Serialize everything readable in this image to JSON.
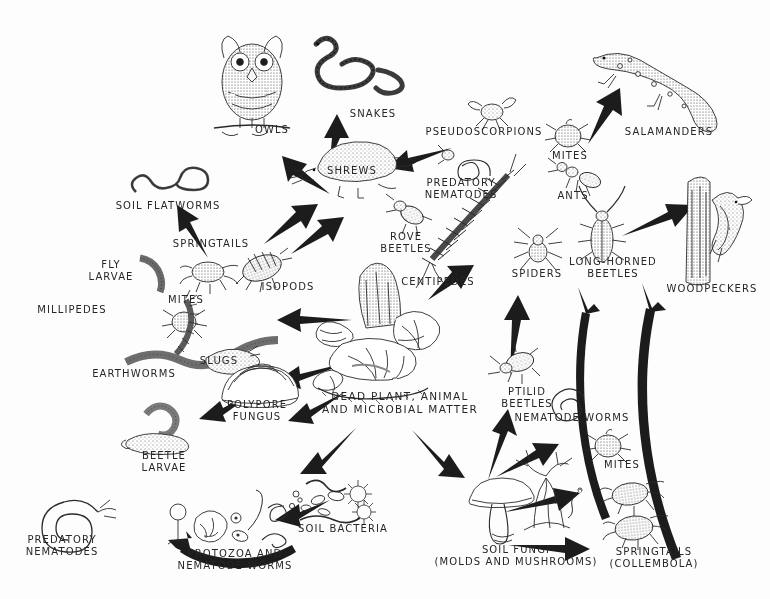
{
  "diagram": {
    "background_color": "#fdfdfd",
    "ink_color": "#262626",
    "style": "pen-and-ink hand-lettered illustration"
  },
  "center": {
    "label": "DEAD PLANT, ANIMAL\nAND MICROBIAL MATTER",
    "icon": "leaf-litter-wood-pile-icon"
  },
  "nodes": [
    {
      "id": "owls",
      "label": "OWLS",
      "icon": "owl-icon",
      "x": 272,
      "y": 131,
      "trophic": "predator"
    },
    {
      "id": "snakes",
      "label": "SNAKES",
      "icon": "snake-icon",
      "x": 373,
      "y": 115,
      "trophic": "predator"
    },
    {
      "id": "shrews",
      "label": "SHREWS",
      "icon": "shrew-icon",
      "x": 352,
      "y": 172,
      "trophic": "predator"
    },
    {
      "id": "salamanders",
      "label": "SALAMANDERS",
      "icon": "salamander-icon",
      "x": 669,
      "y": 133,
      "trophic": "predator"
    },
    {
      "id": "woodpeckers",
      "label": "WOODPECKERS",
      "icon": "woodpecker-on-trunk-icon",
      "x": 712,
      "y": 290,
      "trophic": "predator"
    },
    {
      "id": "pseudoscorpions",
      "label": "PSEUDOSCORPIONS",
      "icon": "pseudoscorpion-icon",
      "x": 484,
      "y": 133,
      "trophic": "predator"
    },
    {
      "id": "mites-upper",
      "label": "MITES",
      "icon": "mite-icon",
      "x": 570,
      "y": 157,
      "trophic": "predator"
    },
    {
      "id": "ants",
      "label": "ANTS",
      "icon": "ant-icon",
      "x": 573,
      "y": 197,
      "trophic": "predator"
    },
    {
      "id": "predatory-nematodes-upper",
      "label": "PREDATORY\nNEMATODES",
      "icon": "coiled-nematode-icon",
      "x": 461,
      "y": 190,
      "trophic": "predator"
    },
    {
      "id": "rove-beetles",
      "label": "ROVE\nBEETLES",
      "icon": "rove-beetle-icon",
      "x": 406,
      "y": 238,
      "trophic": "predator"
    },
    {
      "id": "centipedes",
      "label": "CENTIPEDES",
      "icon": "centipede-icon",
      "x": 438,
      "y": 283,
      "trophic": "predator"
    },
    {
      "id": "spiders",
      "label": "SPIDERS",
      "icon": "spider-icon",
      "x": 537,
      "y": 275,
      "trophic": "predator"
    },
    {
      "id": "long-horned-beetles",
      "label": "LONG-HORNED\nBEETLES",
      "icon": "long-horned-beetle-icon",
      "x": 613,
      "y": 262,
      "trophic": "predator"
    },
    {
      "id": "soil-flatworms",
      "label": "SOIL FLATWORMS",
      "icon": "flatworm-icon",
      "x": 168,
      "y": 207,
      "trophic": "predator"
    },
    {
      "id": "springtails-upper",
      "label": "SPRINGTAILS",
      "icon": "springtail-icon",
      "x": 211,
      "y": 245,
      "trophic": "shredder"
    },
    {
      "id": "fly-larvae",
      "label": "FLY\nLARVAE",
      "icon": "fly-larva-icon",
      "x": 111,
      "y": 272,
      "trophic": "shredder"
    },
    {
      "id": "isopods",
      "label": "ISOPODS",
      "icon": "isopod-icon",
      "x": 288,
      "y": 288,
      "trophic": "shredder"
    },
    {
      "id": "mites-left",
      "label": "MITES",
      "icon": "mite-icon",
      "x": 186,
      "y": 301,
      "trophic": "shredder"
    },
    {
      "id": "millipedes",
      "label": "MILLIPEDES",
      "icon": "millipede-icon",
      "x": 72,
      "y": 311,
      "trophic": "shredder"
    },
    {
      "id": "slugs",
      "label": "SLUGS",
      "icon": "slug-icon",
      "x": 219,
      "y": 362,
      "trophic": "shredder"
    },
    {
      "id": "earthworms",
      "label": "EARTHWORMS",
      "icon": "earthworm-icon",
      "x": 134,
      "y": 375,
      "trophic": "shredder"
    },
    {
      "id": "polypore-fungus",
      "label": "POLYPORE\nFUNGUS",
      "icon": "polypore-bracket-fungus-icon",
      "x": 257,
      "y": 406,
      "trophic": "decomposer"
    },
    {
      "id": "beetle-larvae",
      "label": "BEETLE\nLARVAE",
      "icon": "beetle-larva-icon",
      "x": 164,
      "y": 457,
      "trophic": "shredder"
    },
    {
      "id": "soil-bacteria",
      "label": "SOIL BACTERIA",
      "icon": "bacteria-icon",
      "x": 343,
      "y": 530,
      "trophic": "decomposer"
    },
    {
      "id": "soil-fungi",
      "label": "SOIL FUNGI\n(MOLDS AND MUSHROOMS)",
      "icon": "mushroom-and-mold-icon",
      "x": 516,
      "y": 551,
      "trophic": "decomposer"
    },
    {
      "id": "protozoa",
      "label": "PROTOZOA AND\nNEMATODE WORMS",
      "icon": "protozoa-icon",
      "x": 235,
      "y": 555,
      "trophic": "grazer"
    },
    {
      "id": "predatory-nematodes-lower",
      "label": "PREDATORY\nNEMATODES",
      "icon": "coiled-nematode-icon",
      "x": 62,
      "y": 541,
      "trophic": "predator"
    },
    {
      "id": "ptilid-beetles",
      "label": "PTILID\nBEETLES",
      "icon": "ptilid-beetle-icon",
      "x": 527,
      "y": 393,
      "trophic": "grazer"
    },
    {
      "id": "nematode-worms",
      "label": "NEMATODE WORMS",
      "icon": "coiled-nematode-icon",
      "x": 572,
      "y": 419,
      "trophic": "grazer"
    },
    {
      "id": "mites-lower",
      "label": "MITES",
      "icon": "mite-icon",
      "x": 622,
      "y": 466,
      "trophic": "grazer"
    },
    {
      "id": "springtails-lower",
      "label": "SPRINGTAILS\n(COLLEMBOLA)",
      "icon": "springtail-icon",
      "x": 654,
      "y": 553,
      "trophic": "grazer"
    }
  ],
  "arrow_count": 20,
  "arrow_style": "solid black tapered hand-drawn arrows"
}
